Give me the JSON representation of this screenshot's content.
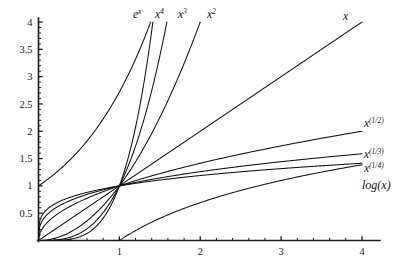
{
  "chart_data": {
    "type": "line",
    "title": "",
    "subtitle": "",
    "xlabel": "",
    "ylabel": "",
    "xlim": [
      0,
      4.2
    ],
    "ylim": [
      0,
      4.05
    ],
    "grid": false,
    "legend_position": "inline-curve-end-labels",
    "background_color": "#ffffff",
    "line_color": "#111111",
    "axis_color": "#1a1a1a",
    "x_ticks_major": [
      1,
      2,
      3,
      4
    ],
    "x_tick_labels": [
      "1",
      "2",
      "3",
      "4"
    ],
    "x_ticks_minor_step": 0.2,
    "y_ticks_major": [
      0.5,
      1,
      1.5,
      2,
      2.5,
      3,
      3.5,
      4
    ],
    "y_tick_labels": [
      "0.5",
      "1",
      "1.5",
      "2",
      "2.5",
      "3",
      "3.5",
      "4"
    ],
    "y_ticks_minor_step": 0.1,
    "series": [
      {
        "name": "e^x",
        "formula": "exp(x)",
        "label": "e",
        "label_sup": "x",
        "label_position": "top",
        "x": [
          0,
          0.1,
          0.2,
          0.3,
          0.4,
          0.5,
          0.6,
          0.7,
          0.8,
          0.9,
          1,
          1.1,
          1.2,
          1.3,
          1.386
        ],
        "values": [
          1,
          1.105,
          1.221,
          1.35,
          1.492,
          1.649,
          1.822,
          2.014,
          2.226,
          2.46,
          2.718,
          3.004,
          3.32,
          3.669,
          4
        ]
      },
      {
        "name": "x^4",
        "formula": "x**4",
        "label": "x",
        "label_sup": "4",
        "label_position": "top",
        "x": [
          0,
          0.2,
          0.4,
          0.5,
          0.6,
          0.7,
          0.8,
          0.9,
          1,
          1.1,
          1.2,
          1.3,
          1.4,
          1.414
        ],
        "values": [
          0,
          0.0016,
          0.0256,
          0.0625,
          0.1296,
          0.2401,
          0.4096,
          0.6561,
          1,
          1.464,
          2.074,
          2.856,
          3.842,
          4
        ]
      },
      {
        "name": "x^3",
        "formula": "x**3",
        "label": "x",
        "label_sup": "3",
        "label_position": "top",
        "x": [
          0,
          0.2,
          0.4,
          0.6,
          0.8,
          1,
          1.1,
          1.2,
          1.3,
          1.4,
          1.5,
          1.587
        ],
        "values": [
          0,
          0.008,
          0.064,
          0.216,
          0.512,
          1,
          1.331,
          1.728,
          2.197,
          2.744,
          3.375,
          4
        ]
      },
      {
        "name": "x^2",
        "formula": "x**2",
        "label": "x",
        "label_sup": "2",
        "label_position": "top",
        "x": [
          0,
          0.25,
          0.5,
          0.75,
          1,
          1.25,
          1.5,
          1.75,
          2
        ],
        "values": [
          0,
          0.0625,
          0.25,
          0.5625,
          1,
          1.5625,
          2.25,
          3.0625,
          4
        ]
      },
      {
        "name": "x",
        "formula": "x",
        "label": "x",
        "label_sup": "",
        "label_position": "top-right",
        "x": [
          0,
          1,
          2,
          3,
          4
        ],
        "values": [
          0,
          1,
          2,
          3,
          4
        ]
      },
      {
        "name": "x^(1/2)",
        "formula": "sqrt(x)",
        "label": "x",
        "label_sup": "(1/2)",
        "label_position": "right",
        "x": [
          0,
          0.1,
          0.25,
          0.5,
          0.75,
          1,
          1.5,
          2,
          2.5,
          3,
          3.5,
          4
        ],
        "values": [
          0,
          0.316,
          0.5,
          0.707,
          0.866,
          1,
          1.225,
          1.414,
          1.581,
          1.732,
          1.871,
          2
        ]
      },
      {
        "name": "x^(1/3)",
        "formula": "x**(1/3)",
        "label": "x",
        "label_sup": "(1/3)",
        "label_position": "right",
        "x": [
          0,
          0.1,
          0.25,
          0.5,
          0.75,
          1,
          1.5,
          2,
          2.5,
          3,
          3.5,
          4
        ],
        "values": [
          0,
          0.464,
          0.63,
          0.794,
          0.909,
          1,
          1.145,
          1.26,
          1.357,
          1.442,
          1.518,
          1.587
        ]
      },
      {
        "name": "x^(1/4)",
        "formula": "x**(1/4)",
        "label": "x",
        "label_sup": "(1/4)",
        "label_position": "right",
        "x": [
          0,
          0.1,
          0.25,
          0.5,
          0.75,
          1,
          1.5,
          2,
          2.5,
          3,
          3.5,
          4
        ],
        "values": [
          0,
          0.562,
          0.707,
          0.841,
          0.931,
          1,
          1.107,
          1.189,
          1.257,
          1.316,
          1.368,
          1.414
        ]
      },
      {
        "name": "log(x)",
        "formula": "ln(x)",
        "label": "log(x)",
        "label_sup": "",
        "label_position": "right",
        "x": [
          1,
          1.25,
          1.5,
          2,
          2.5,
          3,
          3.5,
          4
        ],
        "values": [
          0,
          0.223,
          0.405,
          0.693,
          0.916,
          1.099,
          1.253,
          1.386
        ]
      }
    ]
  },
  "labels": {
    "top": [
      {
        "base": "e",
        "sup": "x"
      },
      {
        "base": "x",
        "sup": "4"
      },
      {
        "base": "x",
        "sup": "3"
      },
      {
        "base": "x",
        "sup": "2"
      },
      {
        "base": "x",
        "sup": ""
      }
    ],
    "right": [
      {
        "base": "x",
        "sup": "(1/2)"
      },
      {
        "base": "x",
        "sup": "(1/3)"
      },
      {
        "base": "x",
        "sup": "(1/4)"
      },
      {
        "base": "log(x)",
        "sup": ""
      }
    ]
  },
  "axes": {
    "x_labels": [
      "1",
      "2",
      "3",
      "4"
    ],
    "y_labels": [
      "0.5",
      "1",
      "1.5",
      "2",
      "2.5",
      "3",
      "3.5",
      "4"
    ]
  }
}
